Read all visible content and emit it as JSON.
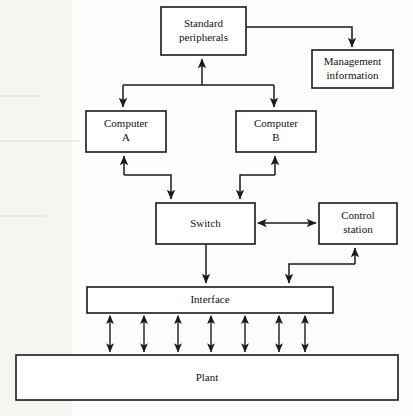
{
  "diagram": {
    "type": "block-diagram",
    "background_color": "#fdfdfb",
    "line_color": "#1a1a1a",
    "box_fill": "#ffffff",
    "nodes": [
      {
        "id": "standard-peripherals",
        "label_line1": "Standard",
        "label_line2": "peripherals",
        "x": 161,
        "y": 7,
        "w": 85,
        "h": 48
      },
      {
        "id": "management-information",
        "label_line1": "Management",
        "label_line2": "information",
        "x": 312,
        "y": 50,
        "w": 81,
        "h": 38
      },
      {
        "id": "computer-a",
        "label_line1": "Computer",
        "label_line2": "A",
        "x": 86,
        "y": 111,
        "w": 80,
        "h": 41
      },
      {
        "id": "computer-b",
        "label_line1": "Computer",
        "label_line2": "B",
        "x": 236,
        "y": 111,
        "w": 80,
        "h": 41
      },
      {
        "id": "switch",
        "label_line1": "Switch",
        "label_line2": "",
        "x": 156,
        "y": 203,
        "w": 99,
        "h": 41
      },
      {
        "id": "control-station",
        "label_line1": "Control",
        "label_line2": "station",
        "x": 319,
        "y": 203,
        "w": 78,
        "h": 41
      },
      {
        "id": "interface",
        "label_line1": "Interface",
        "label_line2": "",
        "x": 87,
        "y": 287,
        "w": 246,
        "h": 26
      },
      {
        "id": "plant",
        "label_line1": "Plant",
        "label_line2": "",
        "x": 16,
        "y": 355,
        "w": 382,
        "h": 45
      }
    ],
    "connections": [
      {
        "id": "peripherals-to-management",
        "from": "standard-peripherals",
        "to": "management-information",
        "arrow": "single"
      },
      {
        "id": "bus-to-peripherals",
        "from": "computer-bus",
        "to": "standard-peripherals",
        "arrow": "single"
      },
      {
        "id": "bus-to-computer-a",
        "from": "computer-bus",
        "to": "computer-a",
        "arrow": "single"
      },
      {
        "id": "bus-to-computer-b",
        "from": "computer-bus",
        "to": "computer-b",
        "arrow": "single"
      },
      {
        "id": "computer-a-to-switch",
        "from": "computer-a",
        "to": "switch",
        "arrow": "double-ended-pair"
      },
      {
        "id": "computer-b-to-switch",
        "from": "computer-b",
        "to": "switch",
        "arrow": "double-ended-pair"
      },
      {
        "id": "switch-to-control-station",
        "from": "switch",
        "to": "control-station",
        "arrow": "double"
      },
      {
        "id": "switch-to-interface",
        "from": "switch",
        "to": "interface",
        "arrow": "single"
      },
      {
        "id": "control-station-to-interface",
        "from": "control-station",
        "to": "interface",
        "arrow": "double-ended-pair"
      },
      {
        "id": "interface-to-plant",
        "from": "interface",
        "to": "plant",
        "arrow": "double",
        "count": 7,
        "x_positions": [
          110,
          144,
          178,
          211,
          245,
          279,
          305
        ]
      }
    ]
  }
}
